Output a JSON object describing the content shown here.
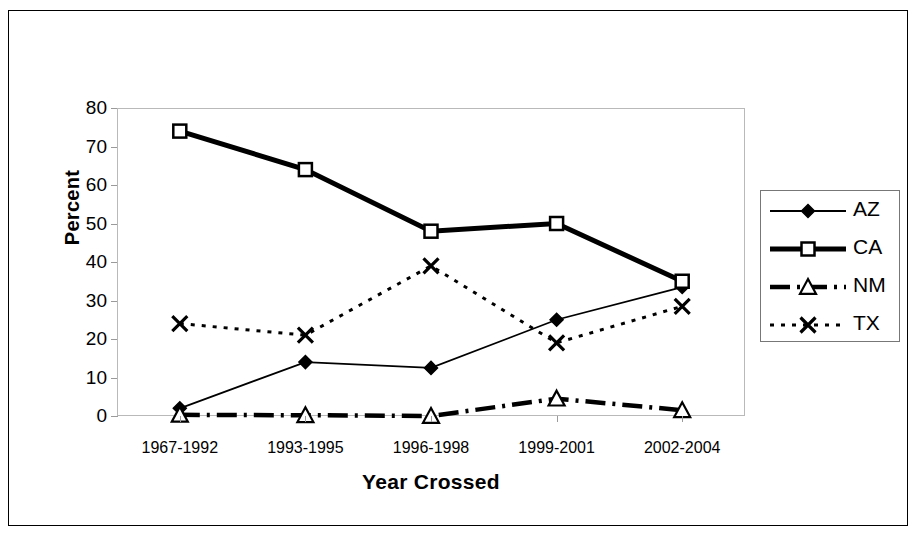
{
  "chart_data": {
    "type": "line",
    "title": "",
    "xlabel": "Year Crossed",
    "ylabel": "Percent",
    "categories": [
      "1967-1992",
      "1993-1995",
      "1996-1998",
      "1999-2001",
      "2002-2004"
    ],
    "ylim": [
      0,
      80
    ],
    "yticks": [
      0,
      10,
      20,
      30,
      40,
      50,
      60,
      70,
      80
    ],
    "grid": false,
    "legend_position": "right",
    "series": [
      {
        "name": "AZ",
        "values": [
          2,
          14,
          12.5,
          25,
          33.5
        ],
        "marker": "filled-diamond",
        "line": "solid-thin",
        "color": "#000000"
      },
      {
        "name": "CA",
        "values": [
          74,
          64,
          48,
          50,
          35
        ],
        "marker": "open-square",
        "line": "solid-thick",
        "color": "#000000"
      },
      {
        "name": "NM",
        "values": [
          0.3,
          0.2,
          0,
          4.5,
          1.5
        ],
        "marker": "open-triangle",
        "line": "dash-dot-thick",
        "color": "#000000"
      },
      {
        "name": "TX",
        "values": [
          24,
          21,
          39,
          19,
          28.5
        ],
        "marker": "x",
        "line": "dotted",
        "color": "#000000"
      }
    ]
  },
  "legend": {
    "items": [
      {
        "label": "AZ"
      },
      {
        "label": "CA"
      },
      {
        "label": "NM"
      },
      {
        "label": "TX"
      }
    ]
  }
}
